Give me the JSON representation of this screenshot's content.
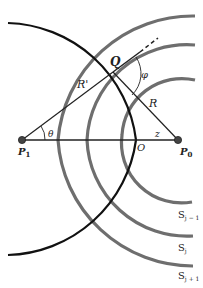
{
  "diagram": {
    "type": "geometry",
    "labels": {
      "Q": "Q",
      "R_prime": "R'",
      "R": "R",
      "phi": "φ",
      "theta": "θ",
      "z": "z",
      "O": "O",
      "P1": "P",
      "P1_sub": "1",
      "P0": "P",
      "P0_sub": "0",
      "S_jm1": "S",
      "S_jm1_sub": "j − 1",
      "S_j": "S",
      "S_j_sub": "j",
      "S_jp1": "S",
      "S_jp1_sub": "j + 1"
    },
    "points": {
      "P1": [
        22,
        140
      ],
      "P0": [
        178,
        140
      ],
      "O": [
        138,
        140
      ],
      "Q": [
        113,
        72
      ]
    },
    "wavefronts": [
      {
        "name": "S_{j-1}",
        "center": "P0",
        "radius": 30
      },
      {
        "name": "S_j",
        "center": "P0",
        "radius": 60
      },
      {
        "name": "S_{j+1}",
        "center": "P0",
        "radius": 92
      }
    ],
    "circle": {
      "center": "P1",
      "radius": 116
    },
    "colors": {
      "wavefront": "#6e6e6e",
      "line": "#111111",
      "point": "#444444"
    }
  }
}
